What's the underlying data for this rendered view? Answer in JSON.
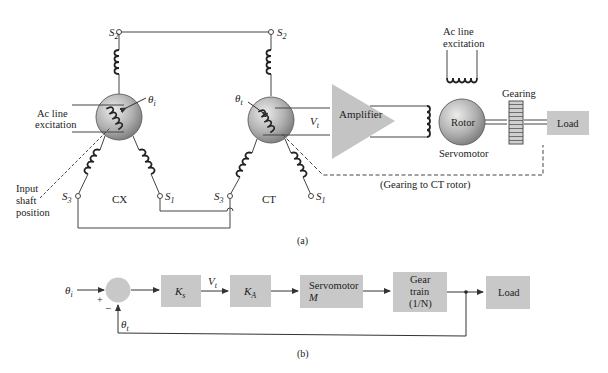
{
  "figure_a": {
    "caption": "(a)",
    "cx": {
      "label": "CX",
      "terminals": {
        "s1": "S",
        "s1_sub": "1",
        "s2": "S",
        "s2_sub": "2",
        "s3": "S",
        "s3_sub": "3"
      },
      "angle_label": "θ",
      "angle_sub": "i",
      "excitation_label_1": "Ac line",
      "excitation_label_2": "excitation",
      "input_label_1": "Input",
      "input_label_2": "shaft",
      "input_label_3": "position"
    },
    "ct": {
      "label": "CT",
      "terminals": {
        "s1": "S",
        "s1_sub": "1",
        "s2": "S",
        "s2_sub": "2",
        "s3": "S",
        "s3_sub": "3"
      },
      "angle_label": "θ",
      "angle_sub": "t",
      "voltage_label": "V",
      "voltage_sub": "t"
    },
    "amplifier_label": "Amplifier",
    "servo": {
      "rotor_label": "Rotor",
      "motor_label": "Servomotor",
      "excitation_label_1": "Ac line",
      "excitation_label_2": "excitation"
    },
    "gearing_label": "Gearing",
    "load_label": "Load",
    "gearing_note": "(Gearing to CT rotor)"
  },
  "figure_b": {
    "caption": "(b)",
    "input": {
      "label": "θ",
      "sub": "i"
    },
    "feedback": {
      "label": "θ",
      "sub": "t"
    },
    "plus_sign": "+",
    "minus_sign": "−",
    "blocks": {
      "ks": {
        "label": "K",
        "sub": "s"
      },
      "ka": {
        "label": "K",
        "sub": "A"
      },
      "servo": {
        "line1": "Servomotor",
        "line2": "M"
      },
      "gear": {
        "line1": "Gear",
        "line2": "train",
        "line3": "(1/N)"
      },
      "load": {
        "label": "Load"
      }
    },
    "signal_vt": {
      "label": "V",
      "sub": "t"
    }
  },
  "colors": {
    "block_fill": "#c8c8c8",
    "line": "#444444",
    "circle_light": "#e6e6e6",
    "circle_dark": "#7a7a7a"
  }
}
